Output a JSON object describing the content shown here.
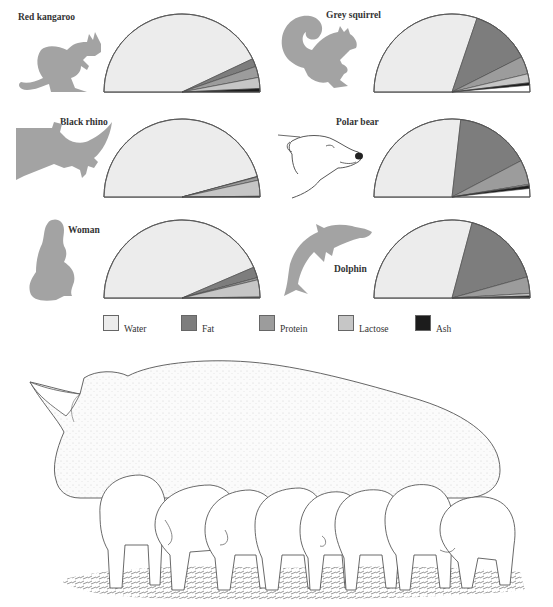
{
  "legend": {
    "items": [
      {
        "key": "water",
        "label": "Water",
        "color": "#ececec"
      },
      {
        "key": "fat",
        "label": "Fat",
        "color": "#7d7d7d"
      },
      {
        "key": "protein",
        "label": "Protein",
        "color": "#9c9c9c"
      },
      {
        "key": "lactose",
        "label": "Lactose",
        "color": "#c6c6c6"
      },
      {
        "key": "ash",
        "label": "Ash",
        "color": "#1c1c1c"
      }
    ]
  },
  "animals": [
    {
      "name": "Red kangaroo",
      "icon": "kangaroo-icon"
    },
    {
      "name": "Grey squirrel",
      "icon": "squirrel-icon"
    },
    {
      "name": "Black rhino",
      "icon": "rhino-icon"
    },
    {
      "name": "Polar bear",
      "icon": "polar-bear-icon"
    },
    {
      "name": "Woman",
      "icon": "woman-icon"
    },
    {
      "name": "Dolphin",
      "icon": "dolphin-icon"
    }
  ],
  "illustration": {
    "subject": "Sow suckling piglets",
    "icon": "sow-with-piglets-illustration"
  },
  "chart_data": {
    "type": "pie",
    "subtype": "semicircle",
    "title": "",
    "legend_position": "bottom",
    "categories": [
      "Water",
      "Fat",
      "Protein",
      "Lactose",
      "Ash"
    ],
    "series": [
      {
        "name": "Red kangaroo",
        "values": [
          86.0,
          3.4,
          4.6,
          4.6,
          1.4
        ]
      },
      {
        "name": "Grey squirrel",
        "values": [
          60.4,
          24.7,
          7.4,
          3.7,
          1.0
        ]
      },
      {
        "name": "Black rhino",
        "values": [
          91.5,
          0.2,
          1.4,
          6.6,
          0.3
        ]
      },
      {
        "name": "Polar bear",
        "values": [
          53.6,
          31.0,
          10.2,
          0.5,
          1.2
        ]
      },
      {
        "name": "Woman",
        "values": [
          87.1,
          4.5,
          0.9,
          7.1,
          0.2
        ]
      },
      {
        "name": "Dolphin",
        "values": [
          58.3,
          33.0,
          6.8,
          1.1,
          0.7
        ]
      }
    ],
    "units": "% of milk by weight (estimated from slice angles)"
  }
}
